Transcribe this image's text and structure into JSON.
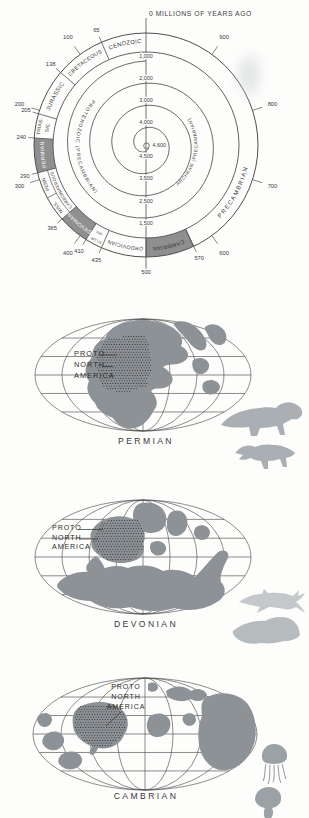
{
  "colors": {
    "line": "#4f4f4f",
    "shade": "#8f8f8f",
    "land": "#8d9296",
    "stipple_dot": "#1c1c1c",
    "text": "#3b3b3b",
    "animal_reptile": "#a9afb2",
    "animal_fish_1": "#c4c8ca",
    "animal_fish_2": "#b6bbbd",
    "animal_jellyfish": "#9ba2a6"
  },
  "spiral_chart": {
    "type": "spiral-geologic-time-scale",
    "title": "0 MILLIONS OF YEARS AGO",
    "unit": "millions of years ago",
    "center_value": "4,600",
    "inner_turn_values_top": [
      "1,000",
      "2,000",
      "3,000",
      "4,000"
    ],
    "inner_turn_values_bottom": [
      "1,500",
      "2,500",
      "3,500",
      "4,500"
    ],
    "ticks": [
      {
        "v": 65
      },
      {
        "v": 100,
        "major": true
      },
      {
        "v": 138
      },
      {
        "v": 200,
        "major": true
      },
      {
        "v": 205
      },
      {
        "v": 240
      },
      {
        "v": 290
      },
      {
        "v": 300,
        "major": true
      },
      {
        "v": 365
      },
      {
        "v": 400,
        "major": true
      },
      {
        "v": 410
      },
      {
        "v": 435
      },
      {
        "v": 500,
        "bottom": true
      },
      {
        "v": 570
      },
      {
        "v": 600,
        "major": true
      },
      {
        "v": 700,
        "major": true
      },
      {
        "v": 800,
        "major": true
      },
      {
        "v": 900,
        "major": true
      }
    ],
    "segments": [
      {
        "name": "CENOZOIC",
        "from": 0,
        "to": 65
      },
      {
        "name": "CRETACEOUS",
        "from": 65,
        "to": 138
      },
      {
        "name": "JURASSIC",
        "from": 138,
        "to": 205
      },
      {
        "name": "TRIASSIC",
        "lines": [
          "TRIAS-",
          "SIC"
        ],
        "from": 205,
        "to": 240
      },
      {
        "name": "PERMIAN",
        "from": 240,
        "to": 290,
        "shaded": true,
        "text_color": "#ffffff"
      },
      {
        "name": "CARBONIFEROUS",
        "from": 290,
        "to": 365,
        "outer_labels": [
          "PENN.",
          "MISS."
        ]
      },
      {
        "name": "DEVONIAN",
        "from": 365,
        "to": 410,
        "shaded": true,
        "text_color": "#ffffff"
      },
      {
        "name": "SILURIAN",
        "lines": [
          "SILUR-",
          "IAN"
        ],
        "from": 410,
        "to": 435
      },
      {
        "name": "ORDOVICIAN",
        "from": 435,
        "to": 500
      },
      {
        "name": "CAMBRIAN",
        "from": 500,
        "to": 570,
        "shaded": true
      },
      {
        "name": "PRECAMBRIAN",
        "from": 570,
        "to": 1000,
        "feet_out": true
      }
    ],
    "spiral_texts": [
      "PROTEROZOIC (PRECAMBRIAN)",
      "ARCHEAN (PRECAMBRIAN)"
    ]
  },
  "maps": [
    {
      "caption": "PERMIAN",
      "annotation": [
        "PROTO",
        "NORTH",
        "AMERICA"
      ],
      "animals": [
        "dinocephalian-reptile-silhouette",
        "gorgonopsian-reptile-silhouette"
      ]
    },
    {
      "caption": "DEVONIAN",
      "annotation": [
        "PROTO",
        "NORTH",
        "AMERICA"
      ],
      "animals": [
        "early-shark-silhouette",
        "armored-fish-silhouette"
      ]
    },
    {
      "caption": "CAMBRIAN",
      "annotation": [
        "PROTO",
        "NORTH",
        "AMERICA"
      ],
      "animals": [
        "jellyfish-silhouette",
        "jellyfish-silhouette"
      ]
    }
  ]
}
